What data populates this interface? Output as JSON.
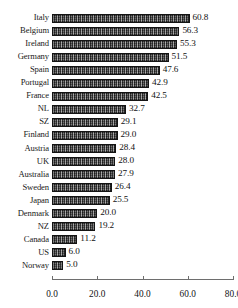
{
  "chart_data": {
    "type": "bar",
    "orientation": "horizontal",
    "title": "",
    "subtitle": "",
    "xlabel": "",
    "ylabel": "",
    "xlim": [
      0.0,
      80.0
    ],
    "xticks": [
      "0.0",
      "20.0",
      "40.0",
      "60.0",
      "80.0"
    ],
    "xtick_values": [
      0,
      20,
      40,
      60,
      80
    ],
    "grid": false,
    "legend": false,
    "legend_position": "none",
    "bar_color": "#4a4a4a",
    "bar_border_color": "#141414",
    "categories": [
      "Italy",
      "Belgium",
      "Ireland",
      "Germany",
      "Spain",
      "Portugal",
      "France",
      "NL",
      "SZ",
      "Finland",
      "Austria",
      "UK",
      "Australia",
      "Sweden",
      "Japan",
      "Denmark",
      "NZ",
      "Canada",
      "US",
      "Norway"
    ],
    "values": [
      60.8,
      56.3,
      55.3,
      51.5,
      47.6,
      42.9,
      42.5,
      32.7,
      29.1,
      29.0,
      28.4,
      28.0,
      27.9,
      26.4,
      25.5,
      20.0,
      19.2,
      11.2,
      6.0,
      5.0
    ],
    "value_labels": [
      "60.8",
      "56.3",
      "55.3",
      "51.5",
      "47.6",
      "42.9",
      "42.5",
      "32.7",
      "29.1",
      "29.0",
      "28.4",
      "28.0",
      "27.9",
      "26.4",
      "25.5",
      "20.0",
      "19.2",
      "11.2",
      "6.0",
      "5.0"
    ]
  }
}
